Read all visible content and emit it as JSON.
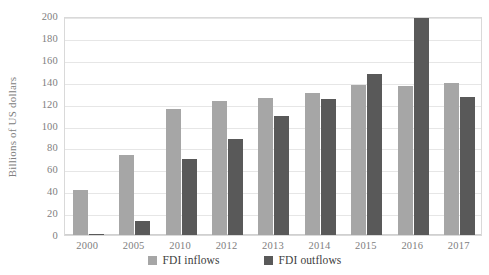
{
  "chart_data": {
    "type": "bar",
    "title": "",
    "subtitle": "",
    "xlabel": "",
    "ylabel": "Billions of US dollars",
    "categories": [
      "2000",
      "2005",
      "2010",
      "2012",
      "2013",
      "2014",
      "2015",
      "2016",
      "2017"
    ],
    "series": [
      {
        "name": "FDI inflows",
        "color": "#a6a6a6",
        "values": [
          41,
          73,
          115,
          122,
          125,
          130,
          137,
          136,
          139
        ]
      },
      {
        "name": "FDI outflows",
        "color": "#595959",
        "values": [
          1,
          13,
          69,
          88,
          109,
          124,
          147,
          198,
          126
        ]
      }
    ],
    "ylim": [
      0,
      200
    ],
    "ytick_values": [
      0,
      20,
      40,
      60,
      80,
      100,
      120,
      140,
      160,
      180,
      200
    ],
    "ytick_labels": [
      "0",
      "20",
      "40",
      "60",
      "80",
      "100",
      "120",
      "140",
      "160",
      "180",
      "200"
    ],
    "grid": true,
    "grid_axis": "y",
    "legend_position": "bottom-center",
    "legend_entries": [
      "FDI inflows",
      "FDI outflows"
    ],
    "annotations": [],
    "plot_background": "#ffffff",
    "gridline_color": "#e6e6e6",
    "axis_text_color": "#808080"
  }
}
